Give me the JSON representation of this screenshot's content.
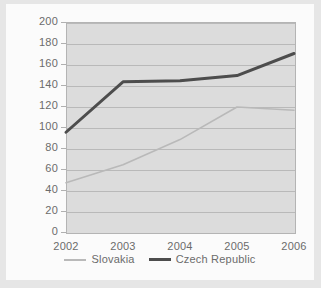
{
  "chart_data": {
    "type": "line",
    "title": "",
    "subtitle": "",
    "xlabel": "",
    "ylabel": "",
    "categories": [
      "2002",
      "2003",
      "2004",
      "2005",
      "2006"
    ],
    "x": [
      2002,
      2003,
      2004,
      2005,
      2006
    ],
    "series": [
      {
        "name": "Slovakia",
        "color": "#b9b9b9",
        "values": [
          47,
          64,
          88,
          119,
          116
        ]
      },
      {
        "name": "Czech Republic",
        "color": "#4d4d4d",
        "values": [
          95,
          143,
          144,
          149,
          170
        ]
      }
    ],
    "ylim": [
      0,
      200
    ],
    "ytick_labels": [
      "200",
      "180",
      "160",
      "140",
      "120",
      "100",
      "80",
      "60",
      "40",
      "20",
      "0"
    ],
    "ytick_values": [
      200,
      180,
      160,
      140,
      120,
      100,
      80,
      60,
      40,
      20,
      0
    ],
    "ytick_step": 20,
    "xtick_labels": [
      "2002",
      "2003",
      "2004",
      "2005",
      "2006"
    ],
    "grid": "horizontal",
    "legend_position": "bottom-center",
    "plot_background": "#dcdcdc",
    "figure_background": "#e6e6e6",
    "page_background": "#fbfbfb",
    "gridline_color": "#b9b9b9",
    "axis_text_color": "#6b6b6b"
  },
  "legend": {
    "entries": [
      {
        "label": "Slovakia"
      },
      {
        "label": "Czech Republic"
      }
    ]
  }
}
